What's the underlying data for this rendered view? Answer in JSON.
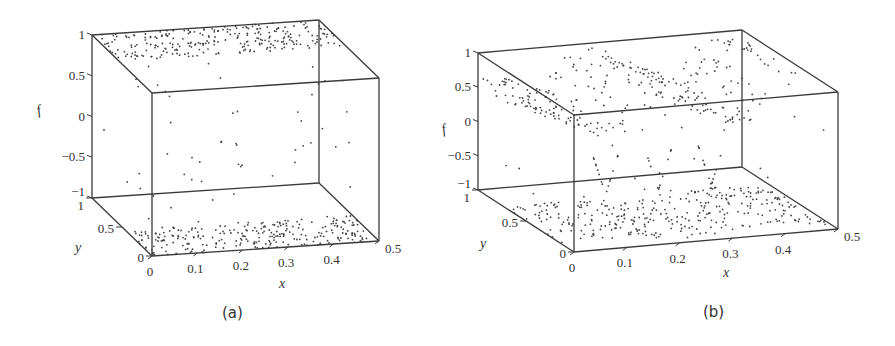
{
  "chart_data": [
    {
      "type": "scatter",
      "subtype": "3d-scatter",
      "caption": "(a)",
      "xlabel": "x",
      "ylabel": "y",
      "zlabel": "f",
      "xlim": [
        0,
        0.5
      ],
      "ylim": [
        0,
        1
      ],
      "zlim": [
        -1,
        1
      ],
      "xticks": [
        "0",
        "0.1",
        "0.2",
        "0.3",
        "0.4",
        "0.5"
      ],
      "yticks": [
        "0",
        "0.5",
        "1"
      ],
      "zticks": [
        "-1",
        "-0.5",
        "0",
        "0.5",
        "1"
      ],
      "grid": false,
      "description": "Most points concentrated on the f=1 and f=-1 planes, sparse points at intermediate f values",
      "clusters": [
        {
          "name": "top plane",
          "f": 1,
          "count": 260,
          "x_range": [
            0,
            0.5
          ],
          "y_range": [
            0.55,
            1
          ]
        },
        {
          "name": "bottom plane",
          "f": -1,
          "count": 260,
          "x_range": [
            0,
            0.5
          ],
          "y_range": [
            0,
            0.45
          ]
        },
        {
          "name": "intermediate",
          "count": 55,
          "f_range": [
            -0.95,
            0.95
          ]
        }
      ],
      "projection": {
        "origin": [
          152,
          256
        ],
        "ex": [
          454,
          -30
        ],
        "ey": [
          -60,
          -58
        ],
        "ef": [
          0,
          -81.5
        ]
      }
    },
    {
      "type": "scatter",
      "subtype": "3d-scatter",
      "caption": "(b)",
      "xlabel": "x",
      "ylabel": "y",
      "zlabel": "f",
      "xlim": [
        0,
        0.5
      ],
      "ylim": [
        0,
        1
      ],
      "zlim": [
        -1,
        1
      ],
      "xticks": [
        "0",
        "0.1",
        "0.2",
        "0.3",
        "0.4",
        "0.5"
      ],
      "yticks": [
        "0",
        "0.5",
        "1"
      ],
      "zticks": [
        "-1",
        "-0.5",
        "0",
        "0.5",
        "1"
      ],
      "grid": false,
      "description": "Points form two wavy bands near f=1 (upper, f≈0.6–1) and f=-1 (lower), with X-shaped crossing patterns at intermediate f",
      "clusters": [
        {
          "name": "upper band",
          "f_range": [
            0.55,
            1.1
          ],
          "count": 300
        },
        {
          "name": "lower band",
          "f_range": [
            -1.1,
            -0.9
          ],
          "count": 300
        },
        {
          "name": "crossings",
          "count": 70,
          "f_range": [
            -0.9,
            0.5
          ]
        }
      ],
      "projection": {
        "origin": [
          574,
          252
        ],
        "ex": [
          528,
          -46
        ],
        "ey": [
          -96,
          -62
        ],
        "ef": [
          0,
          -68.5
        ]
      }
    }
  ]
}
